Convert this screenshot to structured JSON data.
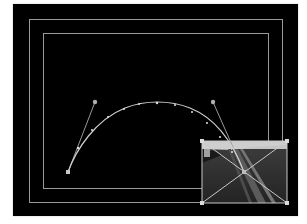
{
  "canvas": {
    "background": "#000000",
    "guide_color": "#9a9a9a"
  },
  "guides": {
    "action_safe": {
      "x": 29,
      "y": 19,
      "w": 254,
      "h": 184
    },
    "title_safe": {
      "x": 43,
      "y": 33,
      "w": 226,
      "h": 156
    }
  },
  "motion_path": {
    "start_point": {
      "x": 68,
      "y": 172
    },
    "end_point": {
      "x": 244,
      "y": 172
    },
    "control_in": {
      "x": 95,
      "y": 102
    },
    "control_out": {
      "x": 213,
      "y": 102
    },
    "path_color": "#d0d0d0",
    "keyframe_ticks": 12
  },
  "clip": {
    "content": "road-photo",
    "bounds": {
      "x": 202,
      "y": 141,
      "w": 85,
      "h": 62
    },
    "center_handle": {
      "x": 244,
      "y": 172
    }
  }
}
